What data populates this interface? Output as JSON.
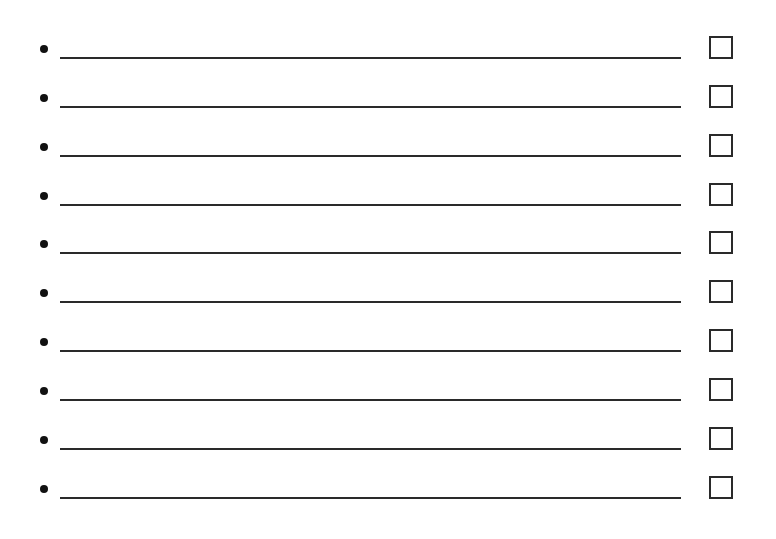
{
  "checklist": {
    "items": [
      {
        "text": "",
        "checked": false
      },
      {
        "text": "",
        "checked": false
      },
      {
        "text": "",
        "checked": false
      },
      {
        "text": "",
        "checked": false
      },
      {
        "text": "",
        "checked": false
      },
      {
        "text": "",
        "checked": false
      },
      {
        "text": "",
        "checked": false
      },
      {
        "text": "",
        "checked": false
      },
      {
        "text": "",
        "checked": false
      },
      {
        "text": "",
        "checked": false
      }
    ],
    "bullet_icon": "bullet-dot",
    "checkbox_icon": "empty-checkbox"
  }
}
